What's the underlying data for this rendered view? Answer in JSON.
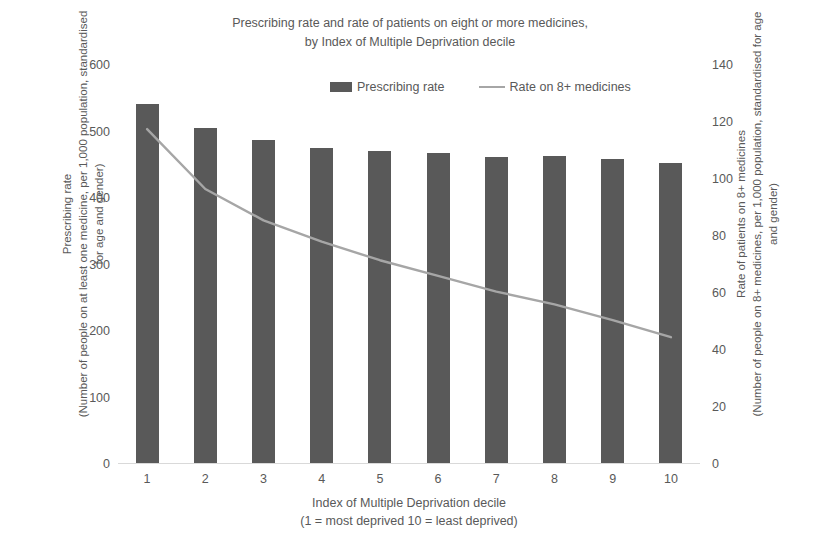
{
  "chart_data": {
    "type": "bar",
    "title": "Prescribing rate and rate of patients on eight or more medicines, by Index of Multiple Deprivation decile",
    "title_lines": [
      "Prescribing rate and rate of patients on eight or more medicines,",
      "by Index of Multiple Deprivation decile"
    ],
    "categories": [
      "1",
      "2",
      "3",
      "4",
      "5",
      "6",
      "7",
      "8",
      "9",
      "10"
    ],
    "series": [
      {
        "name": "Prescribing rate",
        "type": "bar",
        "axis": "left",
        "color": "#595959",
        "values": [
          541,
          506,
          487,
          475,
          470,
          468,
          462,
          463,
          458,
          453
        ]
      },
      {
        "name": "Rate on 8+ medicines",
        "type": "line",
        "axis": "right",
        "color": "#a6a6a6",
        "values": [
          117.5,
          96.5,
          85.5,
          78.0,
          71.5,
          66.0,
          60.5,
          56.0,
          50.5,
          44.5
        ]
      }
    ],
    "xlabel": "Index of Multiple Deprivation decile",
    "xlabel_sub": "(1 = most deprived 10 = least deprived)",
    "ylabel_left_main": "Prescribing rate",
    "ylabel_left_sub": "(Number of people on at least one medicine, per 1,000 population, standardised for age and gender)",
    "ylabel_right_main": "Rate of patients on 8+ medicines",
    "ylabel_right_sub": "(Number of people on 8+ medicines, per 1,000 population, standardised for age and gender)",
    "ylim_left": [
      0,
      600
    ],
    "ylim_right": [
      0,
      140
    ],
    "yticks_left": [
      0,
      100,
      200,
      300,
      400,
      500,
      600
    ],
    "yticks_right": [
      0,
      20,
      40,
      60,
      80,
      100,
      120,
      140
    ],
    "grid": false,
    "legend_position": "top-center",
    "legend": [
      {
        "label": "Prescribing rate",
        "marker": "bar",
        "color": "#595959"
      },
      {
        "label": "Rate on 8+ medicines",
        "marker": "line",
        "color": "#a6a6a6"
      }
    ]
  }
}
